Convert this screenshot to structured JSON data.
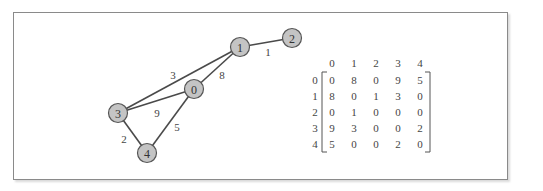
{
  "graph": {
    "nodes": [
      {
        "id": "0",
        "label": "0",
        "x": 194,
        "y": 89
      },
      {
        "id": "1",
        "label": "1",
        "x": 240,
        "y": 47
      },
      {
        "id": "2",
        "label": "2",
        "x": 292,
        "y": 38
      },
      {
        "id": "3",
        "label": "3",
        "x": 118,
        "y": 113
      },
      {
        "id": "4",
        "label": "4",
        "x": 147,
        "y": 153
      }
    ],
    "edges": [
      {
        "from": "1",
        "to": "2",
        "weight": "1",
        "lx": 268,
        "ly": 52
      },
      {
        "from": "0",
        "to": "1",
        "weight": "8",
        "lx": 222,
        "ly": 75
      },
      {
        "from": "3",
        "to": "1",
        "weight": "3",
        "lx": 173,
        "ly": 75
      },
      {
        "from": "3",
        "to": "0",
        "weight": "9",
        "lx": 157,
        "ly": 113
      },
      {
        "from": "0",
        "to": "4",
        "weight": "5",
        "lx": 177,
        "ly": 127
      },
      {
        "from": "3",
        "to": "4",
        "weight": "2",
        "lx": 124,
        "ly": 139
      }
    ]
  },
  "matrix": {
    "column_headers": [
      "0",
      "1",
      "2",
      "3",
      "4"
    ],
    "row_headers": [
      "0",
      "1",
      "2",
      "3",
      "4"
    ],
    "rows": [
      [
        "0",
        "8",
        "0",
        "9",
        "5"
      ],
      [
        "8",
        "0",
        "1",
        "3",
        "0"
      ],
      [
        "0",
        "1",
        "0",
        "0",
        "0"
      ],
      [
        "9",
        "3",
        "0",
        "0",
        "2"
      ],
      [
        "5",
        "0",
        "0",
        "2",
        "0"
      ]
    ]
  }
}
